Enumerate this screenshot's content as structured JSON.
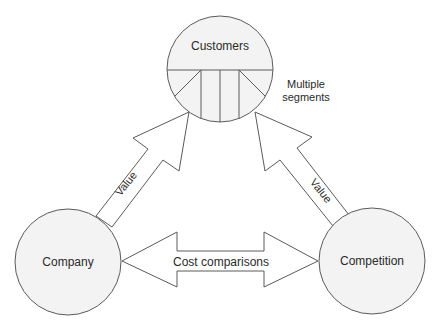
{
  "diagram": {
    "nodes": {
      "customers": {
        "label": "Customers"
      },
      "company": {
        "label": "Company"
      },
      "competition": {
        "label": "Competition"
      }
    },
    "annotations": {
      "segments_line1": "Multiple",
      "segments_line2": "segments"
    },
    "edges": {
      "company_to_customers": {
        "label": "Value"
      },
      "competition_to_customers": {
        "label": "Value"
      },
      "company_competition": {
        "label": "Cost comparisons"
      }
    },
    "colors": {
      "stroke": "#5a5a5a",
      "node_fill": "#f3f3f3",
      "text": "#2a2a2a"
    }
  }
}
